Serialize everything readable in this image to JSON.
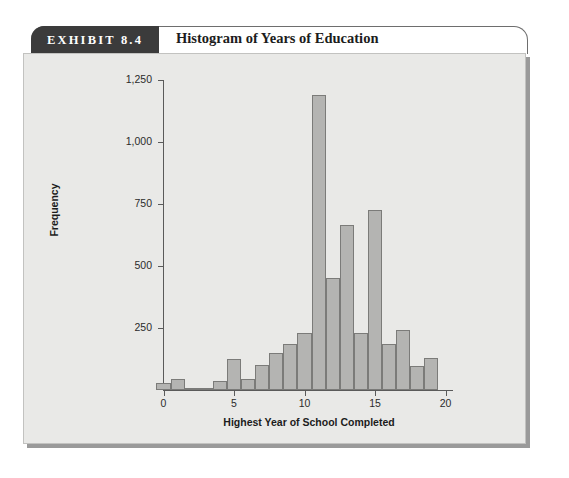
{
  "exhibit": {
    "tab_label": "EXHIBIT 8.4",
    "title": "Histogram of Years of Education"
  },
  "chart_data": {
    "type": "bar",
    "title": "Histogram of Years of Education",
    "xlabel": "Highest Year of School Completed",
    "ylabel": "Frequency",
    "xlim": [
      -0.5,
      20.5
    ],
    "ylim": [
      0,
      1250
    ],
    "grid": false,
    "legend": null,
    "bar_color": "#b4b4b2",
    "bar_edge_color": "#7b7b79",
    "xticks": [
      0,
      5,
      10,
      15,
      20
    ],
    "xtick_labels": [
      "0",
      "5",
      "10",
      "15",
      "20"
    ],
    "yticks": [
      250,
      500,
      750,
      1000,
      1250
    ],
    "ytick_labels": [
      "250",
      "500",
      "750",
      "1,000",
      "1,250"
    ],
    "categories": [
      0,
      1,
      2,
      3,
      4,
      5,
      6,
      7,
      8,
      9,
      10,
      11,
      12,
      13,
      14,
      15,
      16,
      17,
      18,
      19
    ],
    "values": [
      30,
      45,
      10,
      8,
      35,
      125,
      45,
      100,
      150,
      185,
      230,
      1190,
      450,
      665,
      230,
      725,
      185,
      240,
      95,
      130
    ]
  }
}
